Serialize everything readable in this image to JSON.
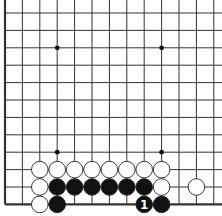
{
  "board": {
    "columns": 13,
    "rows": 12,
    "edges": [
      "left",
      "bottom"
    ],
    "star_points": [
      [
        3,
        2
      ],
      [
        9,
        2
      ],
      [
        3,
        8
      ],
      [
        9,
        8
      ]
    ],
    "stones": [
      {
        "color": "white",
        "col": 2,
        "row": 9
      },
      {
        "color": "white",
        "col": 3,
        "row": 9
      },
      {
        "color": "white",
        "col": 4,
        "row": 9
      },
      {
        "color": "white",
        "col": 5,
        "row": 9
      },
      {
        "color": "white",
        "col": 6,
        "row": 9
      },
      {
        "color": "white",
        "col": 7,
        "row": 9
      },
      {
        "color": "white",
        "col": 8,
        "row": 9
      },
      {
        "color": "white",
        "col": 9,
        "row": 9
      },
      {
        "color": "white",
        "col": 2,
        "row": 10
      },
      {
        "color": "black",
        "col": 3,
        "row": 10
      },
      {
        "color": "black",
        "col": 4,
        "row": 10
      },
      {
        "color": "black",
        "col": 5,
        "row": 10
      },
      {
        "color": "black",
        "col": 6,
        "row": 10
      },
      {
        "color": "black",
        "col": 7,
        "row": 10
      },
      {
        "color": "black",
        "col": 8,
        "row": 10
      },
      {
        "color": "white",
        "col": 9,
        "row": 10
      },
      {
        "color": "white",
        "col": 11,
        "row": 10
      },
      {
        "color": "white",
        "col": 2,
        "row": 11
      },
      {
        "color": "black",
        "col": 3,
        "row": 11
      },
      {
        "color": "black",
        "col": 8,
        "row": 11,
        "label": "1"
      },
      {
        "color": "black",
        "col": 9,
        "row": 11
      }
    ]
  },
  "colors": {
    "line": "#333333",
    "black": "#111111",
    "white": "#ffffff",
    "background": "#ffffff"
  }
}
